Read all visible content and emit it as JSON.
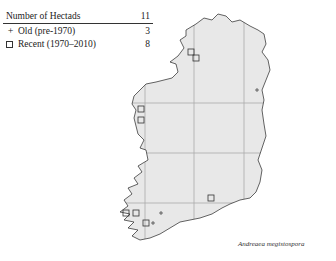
{
  "legend": {
    "header_label": "Number of Hectads",
    "header_count": "11",
    "rows": [
      {
        "symbol": "plus-icon",
        "label": "Old  (pre-1970)",
        "count": "3"
      },
      {
        "symbol": "square-icon",
        "label": "Recent  (1970–2010)",
        "count": "8"
      }
    ]
  },
  "caption": "Andreaea megistospora",
  "map": {
    "land_color": "#e8e8e8",
    "outline_color": "#222222",
    "grid_color": "#aaaaaa",
    "grid_x": [
      145,
      194,
      244
    ],
    "grid_y": [
      103,
      153,
      203
    ],
    "recent_records": [
      [
        191,
        52
      ],
      [
        196,
        58
      ],
      [
        141,
        109
      ],
      [
        141,
        120
      ],
      [
        211,
        198
      ],
      [
        126,
        213
      ],
      [
        136,
        213
      ],
      [
        146,
        223
      ]
    ],
    "old_records": [
      [
        161,
        213
      ],
      [
        153,
        223
      ],
      [
        257,
        90
      ]
    ]
  }
}
